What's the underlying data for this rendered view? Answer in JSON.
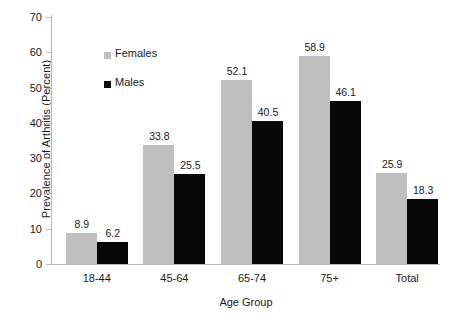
{
  "chart_data": {
    "type": "bar",
    "title": "",
    "xlabel": "Age Group",
    "ylabel": "Prevalence of Arthritis (Percent)",
    "categories": [
      "18-44",
      "45-64",
      "65-74",
      "75+",
      "Total"
    ],
    "series": [
      {
        "name": "Females",
        "color": "#bfbfbf",
        "values": [
          8.9,
          33.8,
          52.1,
          58.9,
          25.9
        ]
      },
      {
        "name": "Males",
        "color": "#080808",
        "values": [
          6.2,
          25.5,
          40.5,
          46.1,
          18.3
        ]
      }
    ],
    "ylim": [
      0,
      70
    ],
    "yticks": [
      0,
      10,
      20,
      30,
      40,
      50,
      60,
      70
    ],
    "ytick_labels": [
      "0",
      "10",
      "20",
      "30",
      "40",
      "50",
      "60",
      "70"
    ],
    "grid": false,
    "legend_position": "inside-upper-left",
    "data_labels": true
  },
  "legend": {
    "entries": [
      {
        "label": "Females",
        "swatch": "gray-square-swatch"
      },
      {
        "label": "Males",
        "swatch": "black-square-swatch"
      }
    ]
  },
  "axes": {
    "y_title": "Prevalence of Arthritis (Percent)",
    "x_title": "Age Group"
  }
}
